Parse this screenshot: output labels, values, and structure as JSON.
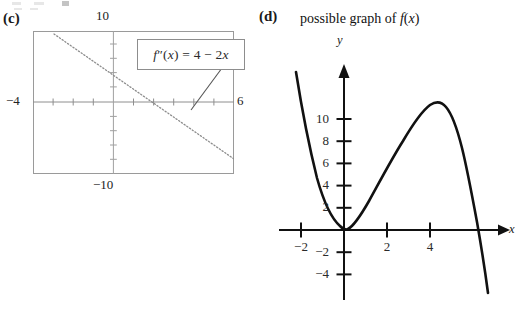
{
  "figure": {
    "panels": [
      {
        "id": "c",
        "letter": "(c)",
        "type": "graphing-calculator-window",
        "formula_label": "f″(x) = 4 − 2x",
        "window": {
          "top_label": "10",
          "bottom_label": "−10",
          "left_label": "−4",
          "right_label": "6"
        }
      },
      {
        "id": "d",
        "letter": "(d)",
        "title": "possible graph of f(x)",
        "type": "coordinate-plane",
        "axis_x_name": "x",
        "axis_y_name": "y",
        "x_tick_labels": [
          "−2",
          "2",
          "4"
        ],
        "y_tick_labels": [
          "10",
          "8",
          "6",
          "4",
          "2",
          "−2",
          "−4"
        ]
      }
    ]
  },
  "chart_data": [
    {
      "type": "line",
      "panel": "c",
      "title": "f″(x) = 4 − 2x",
      "style": "dotted",
      "xlabel": "",
      "ylabel": "",
      "xlim": [
        -4,
        6
      ],
      "ylim": [
        -10,
        10
      ],
      "x_tick_labels": [
        "−4",
        "6"
      ],
      "y_tick_labels": [
        "10",
        "−10"
      ],
      "grid": false,
      "legend": "none",
      "annotation": "f″(x) = 4 − 2x",
      "x": [
        -4,
        -3,
        -2,
        -1,
        0,
        1,
        2,
        3,
        4,
        5,
        6
      ],
      "values": [
        12,
        10,
        8,
        6,
        4,
        2,
        0,
        -2,
        -4,
        -6,
        -8
      ],
      "x_intercept": 2,
      "y_intercept": 4,
      "slope": -2
    },
    {
      "type": "line",
      "panel": "d",
      "title": "possible graph of f(x)",
      "style": "solid",
      "xlabel": "x",
      "ylabel": "y",
      "xlim": [
        -2.6,
        7.0
      ],
      "ylim": [
        -5.5,
        12.5
      ],
      "x_tick_labels": [
        "−2",
        "2",
        "4"
      ],
      "y_tick_labels": [
        "−4",
        "−2",
        "2",
        "4",
        "6",
        "8",
        "10"
      ],
      "grid": false,
      "legend": "none",
      "x": [
        -2.2,
        -2.0,
        -1.75,
        -1.5,
        -1.25,
        -1.0,
        -0.75,
        -0.5,
        -0.25,
        0.0,
        0.25,
        0.5,
        0.75,
        1.0,
        1.5,
        2.0,
        2.5,
        3.0,
        3.5,
        4.0,
        4.3,
        4.6,
        5.0,
        5.4,
        5.8,
        6.1,
        6.4,
        6.6
      ],
      "values": [
        12.4,
        11.0,
        8.6,
        6.6,
        4.8,
        3.3,
        2.0,
        1.0,
        0.3,
        0.0,
        0.2,
        0.8,
        1.7,
        2.7,
        5.0,
        7.4,
        9.3,
        10.6,
        11.0,
        11.0,
        10.6,
        9.7,
        7.6,
        4.6,
        1.0,
        -2.2,
        -4.4,
        -5.3
      ],
      "local_min": {
        "x": 0,
        "y": 0
      },
      "local_max": {
        "x": 4.1,
        "y": 11
      },
      "x_intercepts": [
        0,
        6
      ]
    }
  ]
}
